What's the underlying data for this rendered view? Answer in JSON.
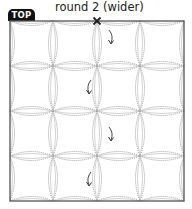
{
  "diagram": {
    "badge_label": "TOP",
    "title": "round 2 (wider)",
    "grid": {
      "rows": 4,
      "cols": 4,
      "x_lines": [
        10,
        53,
        97,
        140,
        184
      ],
      "y_lines": [
        21,
        66,
        111,
        156,
        201
      ]
    },
    "start_mark": {
      "symbol": "X",
      "x": 97,
      "y": 21
    },
    "arrows": [
      {
        "x": 112,
        "y": 30
      },
      {
        "x": 88,
        "y": 80
      },
      {
        "x": 112,
        "y": 127
      },
      {
        "x": 88,
        "y": 172
      }
    ],
    "colors": {
      "border": "#555555",
      "dotted_arc": "#8a8a8a",
      "solid_arc": "#b5b5b5",
      "arrow": "#333333",
      "badge_bg": "#111111"
    }
  }
}
